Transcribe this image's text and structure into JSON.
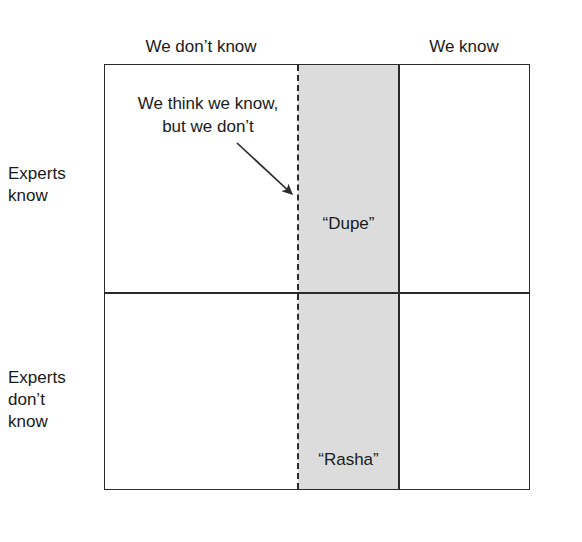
{
  "diagram": {
    "type": "two-by-two-matrix",
    "columns": [
      {
        "id": "we-dont-know",
        "label": "We don’t know"
      },
      {
        "id": "we-know",
        "label": "We know"
      }
    ],
    "rows": [
      {
        "id": "experts-know",
        "label": "Experts\nknow",
        "lines": [
          "Experts",
          "know"
        ]
      },
      {
        "id": "experts-dont-know",
        "label": "Experts\ndon’t\nknow",
        "lines": [
          "Experts",
          "don’t",
          "know"
        ]
      }
    ],
    "row_labels": {
      "top_line1": "Experts",
      "top_line2": "know",
      "bottom_line1": "Experts",
      "bottom_line2": "don’t",
      "bottom_line3": "know"
    },
    "cells": [
      {
        "id": "dupe",
        "label": "“Dupe”",
        "row": "experts-know",
        "column": "we-dont-know",
        "shaded": true
      },
      {
        "id": "rasha",
        "label": "“Rasha”",
        "row": "experts-dont-know",
        "column": "we-dont-know",
        "shaded": true
      }
    ],
    "cell_labels": {
      "dupe": "“Dupe”",
      "rasha": "“Rasha”"
    },
    "annotation": {
      "line1": "We think we know,",
      "line2": "but we don’t",
      "points_to": "dashed-divider"
    },
    "colors": {
      "line": "#2b2b2b",
      "shaded_band": "#dcdcdc",
      "background": "#ffffff",
      "text": "#1a1a1a"
    }
  }
}
